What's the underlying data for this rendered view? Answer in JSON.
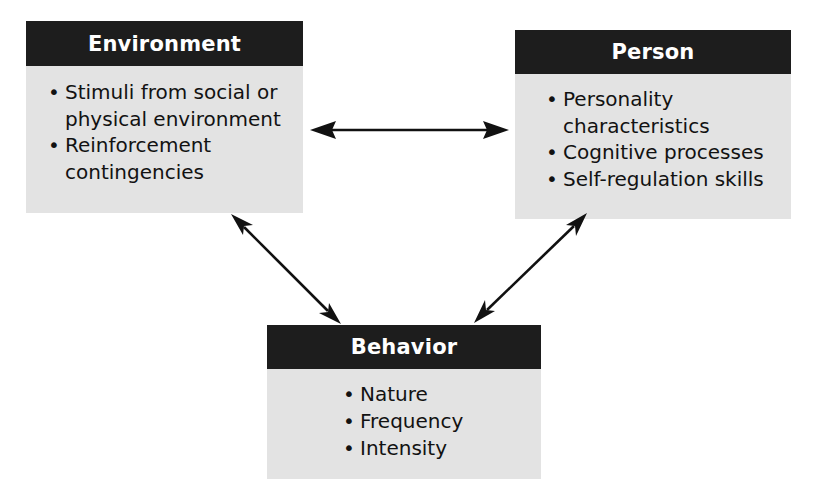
{
  "diagram": {
    "type": "triadic-reciprocal-diagram",
    "background_color": "#ffffff",
    "header_color": "#1d1d1d",
    "header_text_color": "#ffffff",
    "body_color": "#e3e3e3",
    "body_text_color": "#121212",
    "arrow_color": "#111111",
    "nodes": [
      {
        "id": "environment",
        "title": "Environment",
        "bullets": [
          "Stimuli from social or physical environment",
          "Reinforcement contingencies"
        ]
      },
      {
        "id": "person",
        "title": "Person",
        "bullets": [
          "Personality characteristics",
          "Cognitive processes",
          "Self-regulation skills"
        ]
      },
      {
        "id": "behavior",
        "title": "Behavior",
        "bullets": [
          "Nature",
          "Frequency",
          "Intensity"
        ]
      }
    ],
    "connectors": [
      {
        "id": "environment-person",
        "from": "environment",
        "to": "person",
        "style": "double-headed-arrow",
        "orientation": "horizontal"
      },
      {
        "id": "environment-behavior",
        "from": "environment",
        "to": "behavior",
        "style": "double-headed-arrow",
        "orientation": "diagonal-left"
      },
      {
        "id": "person-behavior",
        "from": "person",
        "to": "behavior",
        "style": "double-headed-arrow",
        "orientation": "diagonal-right"
      }
    ]
  }
}
